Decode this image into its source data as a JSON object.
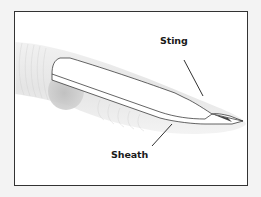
{
  "diagram": {
    "type": "labeled-illustration",
    "labels": {
      "sting": "Sting",
      "sheath": "Sheath"
    },
    "colors": {
      "page_background": "#f3f3f3",
      "frame_border": "#333333",
      "frame_fill": "#ffffff",
      "sheath_fill": "#e4e4e4",
      "sheath_opening": "#c9c9c9",
      "sting_fill": "#ffffff",
      "sting_outline": "#222222",
      "leader_line": "#1a1a1a",
      "label_text": "#1a1a1a"
    }
  }
}
